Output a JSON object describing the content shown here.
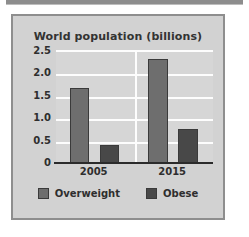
{
  "chart_data": {
    "type": "bar",
    "title": "World population (billions)",
    "xlabel": "",
    "ylabel": "",
    "categories": [
      "2005",
      "2015"
    ],
    "series": [
      {
        "name": "Overweight",
        "color": "#6e6e6e",
        "values": [
          1.7,
          2.35
        ]
      },
      {
        "name": "Obese",
        "color": "#484848",
        "values": [
          0.42,
          0.78
        ]
      }
    ],
    "ylim": [
      0,
      2.5
    ],
    "yticks": [
      "2.5",
      "2.0",
      "1.5",
      "1.0",
      "0.5",
      "0"
    ],
    "ytick_values": [
      2.5,
      2.0,
      1.5,
      1.0,
      0.5,
      0
    ],
    "grid": true,
    "grid_color": "#fdfdfd",
    "legend_position": "bottom",
    "plot_background": "#d6d6d6",
    "panel_background": "#d2d2d2",
    "panel_border_color": "#8e8e8e",
    "axis_color": "#2b2b2b"
  },
  "figure": {
    "title": "World population (billions)"
  },
  "legend": {
    "items": [
      {
        "label": "Overweight"
      },
      {
        "label": "Obese"
      }
    ]
  }
}
